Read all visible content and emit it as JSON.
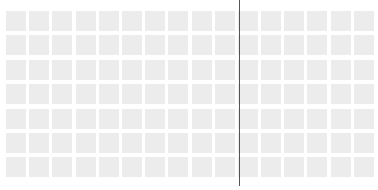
{
  "grid": {
    "columns": 16,
    "rows": 7,
    "tile_color": "#ececec",
    "background_color": "#ffffff"
  },
  "divider": {
    "x": 239,
    "color": "#555555"
  }
}
